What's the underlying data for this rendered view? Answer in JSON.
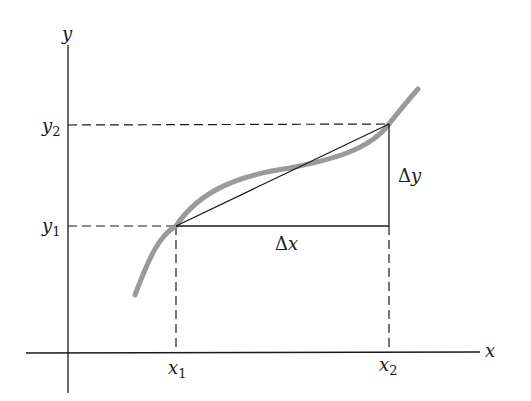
{
  "diagram": {
    "type": "secant-slope-illustration",
    "axes": {
      "x_label": "x",
      "y_label": "y"
    },
    "points": {
      "x1": {
        "label": "x",
        "sub": "1"
      },
      "x2": {
        "label": "x",
        "sub": "2"
      },
      "y1": {
        "label": "y",
        "sub": "1"
      },
      "y2": {
        "label": "y",
        "sub": "2"
      }
    },
    "annotations": {
      "delta_x": {
        "symbol": "Δ",
        "var": "x"
      },
      "delta_y": {
        "symbol": "Δ",
        "var": "y"
      }
    },
    "colors": {
      "curve": "#9a9a9a",
      "lines": "#1a1a1a",
      "background": "#ffffff"
    }
  }
}
